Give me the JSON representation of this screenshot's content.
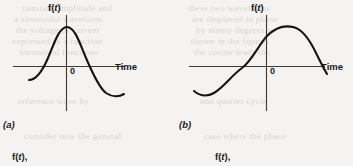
{
  "page": {
    "width": 353,
    "height": 166,
    "background_color": "#f4f3f1",
    "ink_color": "#1b1b1b",
    "ghost_text_color": "#d8d6d3"
  },
  "figures": [
    {
      "id": "a",
      "caption": "(a)",
      "y_axis_label": "f(t)",
      "x_axis_label": "Time",
      "origin_label": "0",
      "waveform": "cosine",
      "description": "cosine-like wave: rises from lower left, peaks just left of the vertical axis, descends through the time axis and bottoms out at right"
    },
    {
      "id": "b",
      "caption": "(b)",
      "y_axis_label": "f(t)",
      "x_axis_label": "Time",
      "origin_label": "0",
      "waveform": "sine",
      "description": "sine-like wave: trough at lower left, crosses zero at the origin, peaks to the right of the vertical axis then descends"
    }
  ],
  "next_row_labels": [
    {
      "text": "f(t)"
    },
    {
      "text": "f(t)"
    }
  ],
  "ghost_text": [
    {
      "text": "constant amplitude and",
      "x": 22,
      "y": 3
    },
    {
      "text": "a sinusoidal waveform",
      "x": 14,
      "y": 14
    },
    {
      "text": "the voltage or current",
      "x": 16,
      "y": 25
    },
    {
      "text": "expressed as a function",
      "x": 12,
      "y": 36
    },
    {
      "text": "sinusoidal functions",
      "x": 20,
      "y": 47
    },
    {
      "text": "these two waveforms",
      "x": 188,
      "y": 3
    },
    {
      "text": "are displaced in phase",
      "x": 192,
      "y": 14
    },
    {
      "text": "by ninety degrees as",
      "x": 196,
      "y": 25
    },
    {
      "text": "shown in the figures",
      "x": 190,
      "y": 36
    },
    {
      "text": "the cosine leads the",
      "x": 194,
      "y": 47
    },
    {
      "text": "reference wave by",
      "x": 18,
      "y": 96
    },
    {
      "text": "one quarter cycle",
      "x": 200,
      "y": 96
    },
    {
      "text": "consider now the general",
      "x": 24,
      "y": 131
    },
    {
      "text": "case where the phase",
      "x": 204,
      "y": 131
    }
  ]
}
